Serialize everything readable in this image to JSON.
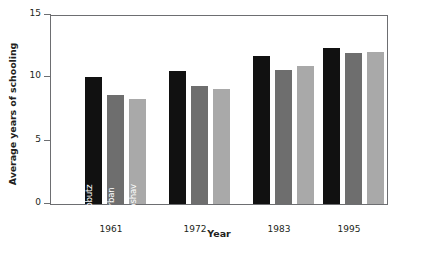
{
  "chart_data": {
    "type": "bar",
    "title": "",
    "xlabel": "Year",
    "ylabel": "Average years of schooling",
    "categories": [
      "1961",
      "1972",
      "1983",
      "1995"
    ],
    "ylim": [
      0,
      15
    ],
    "yticks": [
      0,
      5,
      10,
      15
    ],
    "ytick_labels": [
      "0",
      "5",
      "10",
      "15"
    ],
    "grid": false,
    "legend_position": "inside-first-group-rotated-bar-labels",
    "series": [
      {
        "name": "Kibbutz",
        "color": "#111111",
        "values": [
          10.0,
          10.5,
          11.7,
          12.3
        ]
      },
      {
        "name": "Urban",
        "color": "#6e6e6e",
        "values": [
          8.6,
          9.3,
          10.6,
          11.9
        ]
      },
      {
        "name": "Moshav",
        "color": "#a9a9a9",
        "values": [
          8.3,
          9.1,
          10.9,
          12.0
        ]
      }
    ],
    "annotations": [
      {
        "text": "Kibbutz",
        "group": "1961",
        "series": "Kibbutz",
        "orientation": "vertical"
      },
      {
        "text": "Urban",
        "group": "1961",
        "series": "Urban",
        "orientation": "vertical"
      },
      {
        "text": "Moshav",
        "group": "1961",
        "series": "Moshav",
        "orientation": "vertical"
      }
    ]
  },
  "axis": {
    "y_title": "Average years of schooling",
    "x_title": "Year",
    "y_labels": {
      "t0": "0",
      "t1": "5",
      "t2": "10",
      "t3": "15"
    },
    "x_labels": {
      "g0": "1961",
      "g1": "1972",
      "g2": "1983",
      "g3": "1995"
    }
  },
  "series_labels": {
    "kibbutz": "Kibbutz",
    "urban": "Urban",
    "moshav": "Moshav"
  },
  "colors": {
    "kibbutz": "#111111",
    "urban": "#6e6e6e",
    "moshav": "#a9a9a9",
    "axis": "#6d6e71",
    "text": "#231f20",
    "background": "#ffffff"
  }
}
